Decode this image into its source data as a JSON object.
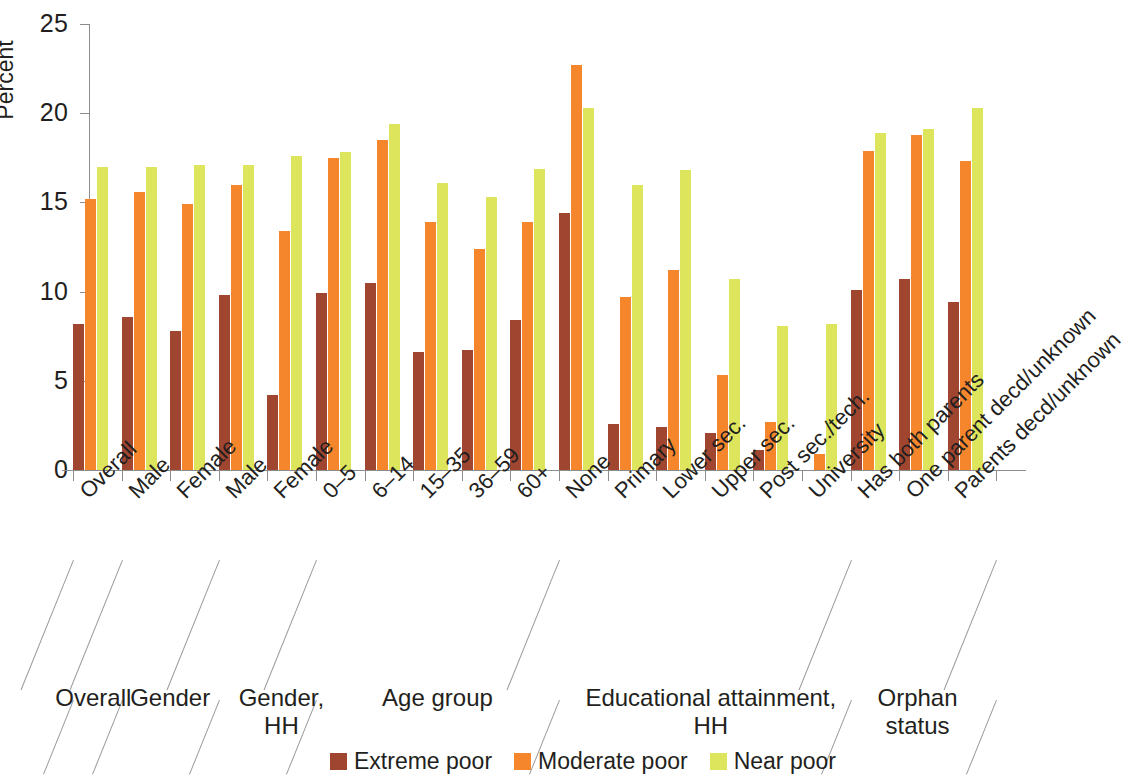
{
  "chart_data": {
    "type": "bar",
    "title": "",
    "xlabel": "",
    "ylabel": "Percent",
    "ylim": [
      0,
      25
    ],
    "yticks": [
      0,
      5,
      10,
      15,
      20,
      25
    ],
    "grid": false,
    "legend_position": "bottom-center",
    "categories": [
      "Overall",
      "Male",
      "Female",
      "Male",
      "Female",
      "0–5",
      "6–14",
      "15–35",
      "36–59",
      "60+",
      "None",
      "Primary",
      "Lower sec.",
      "Upper sec.",
      "Post sec./tech.",
      "University",
      "Has both parents",
      "One parent decd/unknown",
      "Parents decd/unknown"
    ],
    "series": [
      {
        "name": "Extreme poor",
        "color": "#A0452F",
        "values": [
          8.2,
          8.6,
          7.8,
          9.8,
          4.2,
          9.9,
          10.5,
          6.6,
          6.7,
          8.4,
          14.4,
          2.6,
          2.4,
          2.1,
          1.1,
          0.0,
          10.1,
          10.7,
          9.4
        ]
      },
      {
        "name": "Moderate poor",
        "color": "#F5862C",
        "values": [
          15.2,
          15.6,
          14.9,
          16.0,
          13.4,
          17.5,
          18.5,
          13.9,
          12.4,
          13.9,
          22.7,
          9.7,
          11.2,
          5.3,
          2.7,
          0.9,
          17.9,
          18.8,
          17.3
        ]
      },
      {
        "name": "Near poor",
        "color": "#DDE55C",
        "values": [
          17.0,
          17.0,
          17.1,
          17.1,
          17.6,
          17.8,
          19.4,
          16.1,
          15.3,
          16.9,
          20.3,
          16.0,
          16.8,
          10.7,
          8.1,
          8.2,
          18.9,
          19.1,
          20.3
        ]
      }
    ],
    "groups": [
      {
        "label": "Overall",
        "start": 0,
        "end": 0
      },
      {
        "label": "Gender",
        "start": 1,
        "end": 2
      },
      {
        "label": "Gender,\nHH",
        "start": 3,
        "end": 4
      },
      {
        "label": "Age group",
        "start": 5,
        "end": 9
      },
      {
        "label": "Educational attainment, HH",
        "start": 10,
        "end": 15
      },
      {
        "label": "Orphan\nstatus",
        "start": 16,
        "end": 18
      }
    ]
  },
  "legend": {
    "items": [
      {
        "label": "Extreme poor",
        "key": "extreme"
      },
      {
        "label": "Moderate poor",
        "key": "moderate"
      },
      {
        "label": "Near poor",
        "key": "near"
      }
    ]
  }
}
